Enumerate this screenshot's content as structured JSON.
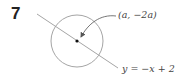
{
  "problem": {
    "number": "7"
  },
  "diagram": {
    "circle": {
      "cx": 77,
      "cy": 41,
      "r": 26,
      "stroke": "#9a9a9a"
    },
    "line": {
      "x1": 37,
      "y1": 14,
      "x2": 118,
      "y2": 68,
      "stroke": "#9a9a9a"
    },
    "center_point": {
      "x": 77,
      "y": 41
    },
    "point_label": "(a, −2a)",
    "line_label": "y = −x + 2"
  }
}
